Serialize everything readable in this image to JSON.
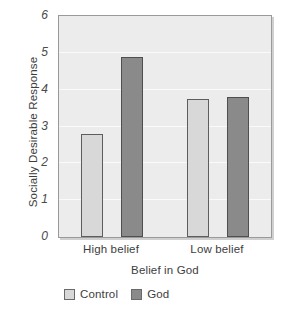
{
  "chart_data": {
    "type": "bar",
    "title": "",
    "xlabel": "Belief in God",
    "ylabel": "Socially Desirable Response",
    "categories": [
      "High belief",
      "Low belief"
    ],
    "series": [
      {
        "name": "Control",
        "values": [
          2.8,
          3.75
        ],
        "color": "#d8d8d8"
      },
      {
        "name": "God",
        "values": [
          4.9,
          3.8
        ],
        "color": "#8a8a8a"
      }
    ],
    "ylim": [
      0,
      6
    ],
    "ytick_labels": [
      "0",
      "1",
      "2",
      "3",
      "4",
      "5",
      "6"
    ],
    "ytick_values": [
      0,
      1,
      2,
      3,
      4,
      5,
      6
    ],
    "grid": true,
    "grid_axis": "y",
    "legend_position": "bottom-left",
    "plot_background": "#ececec",
    "gridline_color": "#fafafa",
    "frame_color": "#9a9a9a"
  },
  "legend": {
    "entries": [
      {
        "label": "Control",
        "color": "#d8d8d8"
      },
      {
        "label": "God",
        "color": "#8a8a8a"
      }
    ]
  }
}
